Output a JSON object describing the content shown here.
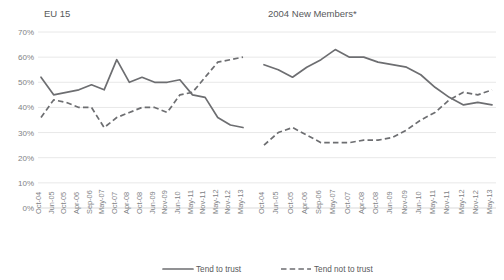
{
  "chart_data": {
    "type": "line",
    "title": "",
    "panels": [
      {
        "title": "EU 15",
        "categories": [
          "Oct-04",
          "Jun-05",
          "Oct-05",
          "Apr-06",
          "Sep-06",
          "May-07",
          "Oct-07",
          "Apr-08",
          "Oct-08",
          "Jun-09",
          "Nov-09",
          "Jun-10",
          "May-11",
          "Nov-11",
          "May-12",
          "Nov-12",
          "May-13"
        ],
        "series": [
          {
            "name": "Tend to trust",
            "style": "solid",
            "values": [
              52,
              45,
              46,
              47,
              49,
              47,
              59,
              50,
              52,
              50,
              50,
              51,
              45,
              44,
              36,
              33,
              32
            ]
          },
          {
            "name": "Tend not to trust",
            "style": "dashed",
            "values": [
              36,
              43,
              42,
              40,
              40,
              32,
              36,
              38,
              40,
              40,
              38,
              45,
              46,
              52,
              58,
              59,
              60
            ]
          }
        ]
      },
      {
        "title": "2004 New Members*",
        "categories": [
          "Oct-04",
          "Jun-05",
          "Oct-05",
          "Apr-06",
          "Sep-06",
          "May-07",
          "Oct-07",
          "Apr-08",
          "Oct-08",
          "Jun-09",
          "Nov-09",
          "Jun-10",
          "May-11",
          "Nov-11",
          "May-12",
          "Nov-12",
          "May-13"
        ],
        "series": [
          {
            "name": "Tend to trust",
            "style": "solid",
            "values": [
              57,
              55,
              52,
              56,
              59,
              63,
              60,
              60,
              58,
              57,
              56,
              53,
              48,
              44,
              41,
              42,
              41
            ]
          },
          {
            "name": "Tend not to trust",
            "style": "dashed",
            "values": [
              25,
              30,
              32,
              29,
              26,
              26,
              26,
              27,
              27,
              28,
              31,
              35,
              38,
              43,
              46,
              45,
              47
            ]
          }
        ]
      }
    ],
    "ylabel": "",
    "xlabel": "",
    "ylim": [
      0,
      70
    ],
    "ytick_labels": [
      "0%",
      "10%",
      "20%",
      "30%",
      "40%",
      "50%",
      "60%",
      "70%"
    ],
    "ytick_values": [
      0,
      10,
      20,
      30,
      40,
      50,
      60,
      70
    ],
    "grid": true,
    "legend_position": "bottom",
    "legend": [
      {
        "label": "Tend to trust",
        "style": "solid"
      },
      {
        "label": "Tend not to trust",
        "style": "dashed"
      }
    ],
    "colors": {
      "line": "#6d6e71",
      "grid": "#e8e8e8",
      "text": "#58595b"
    }
  }
}
